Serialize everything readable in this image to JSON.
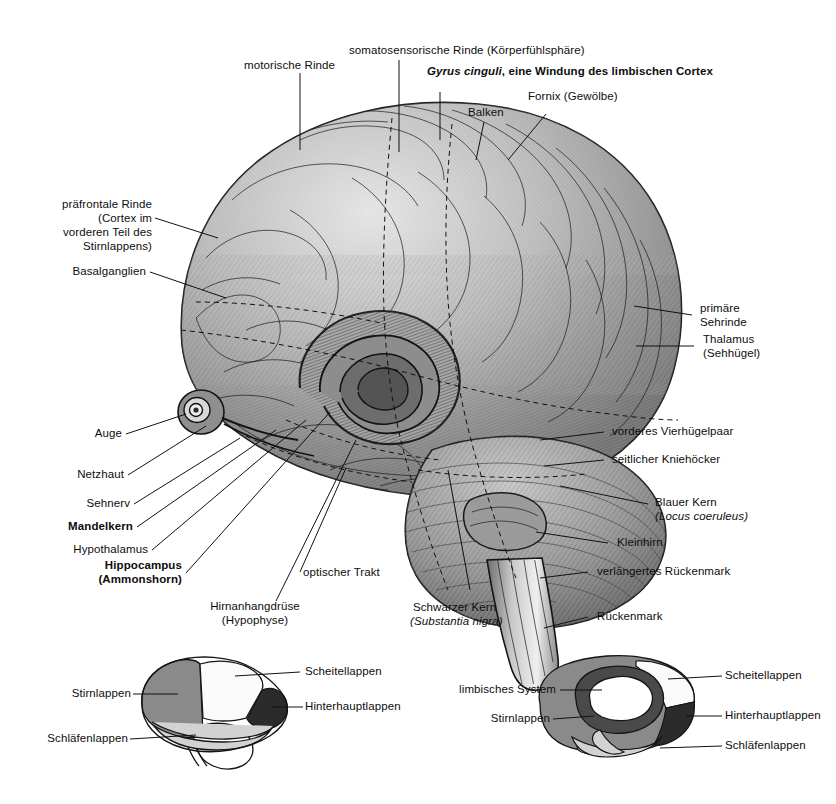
{
  "figure": {
    "background_color": "#ffffff",
    "ink_color": "#111111"
  },
  "main_labels": {
    "motorische_rinde": "motorische Rinde",
    "somatosensorische_rinde": "somatosensorische Rinde (Körperfühlsphäre)",
    "gyrus_cinguli_italic": "Gyrus cinguli",
    "gyrus_cinguli_rest": ", eine Windung des limbischen Cortex",
    "balken": "Balken",
    "fornix": "Fornix (Gewölbe)",
    "praefrontale_rinde_l1": "präfrontale Rinde",
    "praefrontale_rinde_l2": "(Cortex im",
    "praefrontale_rinde_l3": "vorderen Teil des",
    "praefrontale_rinde_l4": "Stirnlappens)",
    "basalganglien": "Basalganglien",
    "auge": "Auge",
    "netzhaut": "Netzhaut",
    "sehnerv": "Sehnerv",
    "mandelkern": "Mandelkern",
    "hypothalamus": "Hypothalamus",
    "hippocampus_l1": "Hippocampus",
    "hippocampus_l2": "(Ammonshorn)",
    "optischer_trakt": "optischer Trakt",
    "hirnanhangdruese_l1": "Hirnanhangdrüse",
    "hirnanhangdruese_l2": "(Hypophyse)",
    "schwarzer_kern_l1": "Schwarzer Kern",
    "schwarzer_kern_l2": "(Substantia nigra)",
    "primaere_sehrinde_l1": "primäre",
    "primaere_sehrinde_l2": "Sehrinde",
    "thalamus_l1": "Thalamus",
    "thalamus_l2": "(Sehhügel)",
    "vorderes_vierhuegelpaar": "vorderes Vierhügelpaar",
    "seitlicher_kniehoecker": "seitlicher Kniehöcker",
    "blauer_kern_l1": "Blauer Kern",
    "blauer_kern_l2": "(Locus coeruleus)",
    "kleinhirn": "Kleinhirn",
    "verlaengertes_rueckenmark": "verlängertes Rückenmark",
    "rueckenmark": "Rückenmark"
  },
  "lateral_view": {
    "caption": "Seitenansicht - Hirnlappen",
    "labels": {
      "stirnlappen": "Stirnlappen",
      "schlaefenlappen": "Schläfenlappen",
      "scheitellappen": "Scheitellappen",
      "hinterhauptlappen": "Hinterhauptlappen"
    },
    "lobe_colors": {
      "frontal": "#8a8a8a",
      "parietal": "#fafafa",
      "occipital": "#2b2b2b",
      "temporal": "#d2d2d2",
      "cerebellum": "#ffffff"
    }
  },
  "medial_view": {
    "caption": "Medianansicht - Hirnlappen und limbisches System",
    "labels": {
      "limbisches_system": "limbisches System",
      "stirnlappen": "Stirnlappen",
      "scheitellappen": "Scheitellappen",
      "hinterhauptlappen": "Hinterhauptlappen",
      "schlaefenlappen": "Schläfenlappen"
    },
    "lobe_colors": {
      "frontal": "#8a8a8a",
      "limbic": "#4a4a4a",
      "parietal": "#fafafa",
      "occipital": "#2b2b2b",
      "temporal": "#d2d2d2",
      "corpus_callosum": "#ffffff"
    }
  }
}
